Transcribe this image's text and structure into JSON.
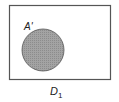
{
  "diagram": {
    "type": "venn",
    "universe_label": "D",
    "universe_subscript": "1",
    "set_label": "A'",
    "set_fill": "#9a9a9a",
    "border_color": "#555555"
  }
}
